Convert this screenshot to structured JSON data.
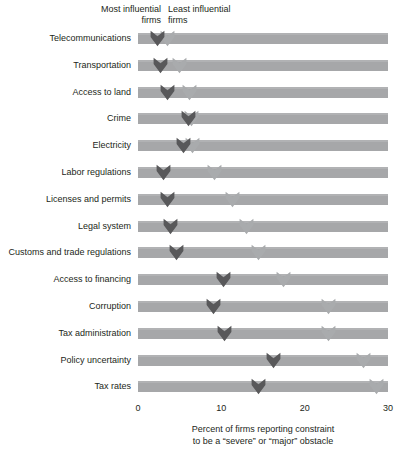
{
  "legend": {
    "most_influential": "Most influential\nfirms",
    "most_influential_line1": "Most influential",
    "most_influential_line2": "firms",
    "least_influential_line1": "Least influential",
    "least_influential_line2": "firms"
  },
  "axis": {
    "ticks": [
      "0",
      "10",
      "20",
      "30"
    ],
    "caption_line1": "Percent of firms reporting constraint",
    "caption_line2": "to be a “severe” or “major” obstacle"
  },
  "colors": {
    "bar": "#a6a7a9",
    "marker_dark": "#58585a",
    "marker_light": "#a9abad",
    "text": "#231f20",
    "background": "#ffffff"
  },
  "chart_data": {
    "type": "bar",
    "title": "",
    "subtitle": "",
    "xlabel": "Percent of firms reporting constraint to be a “severe” or “major” obstacle",
    "ylabel": "",
    "xlim": [
      0,
      30
    ],
    "xticks": [
      0,
      10,
      20,
      30
    ],
    "grid": true,
    "legend_position": "top",
    "categories": [
      "Telecommunications",
      "Transportation",
      "Access to land",
      "Crime",
      "Electricity",
      "Labor regulations",
      "Licenses and permits",
      "Legal system",
      "Customs and trade regulations",
      "Access to financing",
      "Corruption",
      "Tax administration",
      "Policy uncertainty",
      "Tax rates"
    ],
    "series": [
      {
        "name": "Most influential firms",
        "color": "#58585a",
        "values": [
          2.3,
          2.7,
          3.5,
          6.1,
          5.4,
          3.1,
          3.5,
          3.9,
          4.6,
          10.2,
          9.0,
          10.4,
          16.2,
          14.4
        ]
      },
      {
        "name": "Least influential firms",
        "color": "#a9abad",
        "values": [
          3.5,
          5.0,
          6.2,
          6.4,
          6.5,
          9.2,
          11.3,
          13.0,
          14.4,
          17.4,
          22.9,
          22.8,
          27.0,
          28.6
        ]
      }
    ]
  }
}
